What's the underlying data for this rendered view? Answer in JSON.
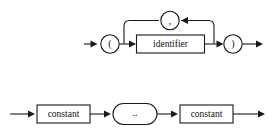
{
  "page": {
    "background_color": "#ffffff",
    "line_color": "#1a1a1a",
    "text_color": "#111111",
    "width": 277,
    "height": 137
  },
  "diagrams": [
    {
      "name": "identifier-list-diagram",
      "description": "Parenthesized comma-separated identifier list",
      "nodes": [
        {
          "id": "open-paren",
          "kind": "terminal-circle",
          "label": "("
        },
        {
          "id": "identifier",
          "kind": "nonterminal-box",
          "label": "identifier"
        },
        {
          "id": "comma",
          "kind": "terminal-circle",
          "label": ","
        },
        {
          "id": "close-paren",
          "kind": "terminal-circle",
          "label": ")"
        }
      ],
      "loop": {
        "name": "comma-repeat-loop",
        "separator_label": ","
      }
    },
    {
      "name": "constant-range-diagram",
      "description": "Constant range using double dot",
      "nodes": [
        {
          "id": "constant-left",
          "kind": "nonterminal-box",
          "label": "constant"
        },
        {
          "id": "range-dots",
          "kind": "terminal-stadium",
          "label": ".."
        },
        {
          "id": "constant-right",
          "kind": "nonterminal-box",
          "label": "constant"
        }
      ]
    }
  ],
  "icons": {
    "arrow_right": "arrow-right-icon",
    "arrow_left": "arrow-left-icon"
  }
}
